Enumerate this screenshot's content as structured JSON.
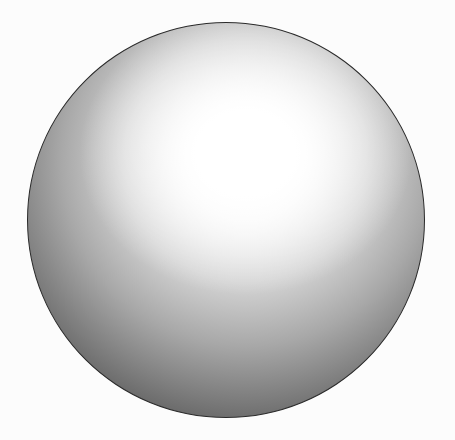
{
  "figure": {
    "colors": {
      "background": "#fcfcfc",
      "outline": "#2a2a2a",
      "highlight": "#ffffff",
      "shadow": "#3a3a3a"
    }
  }
}
